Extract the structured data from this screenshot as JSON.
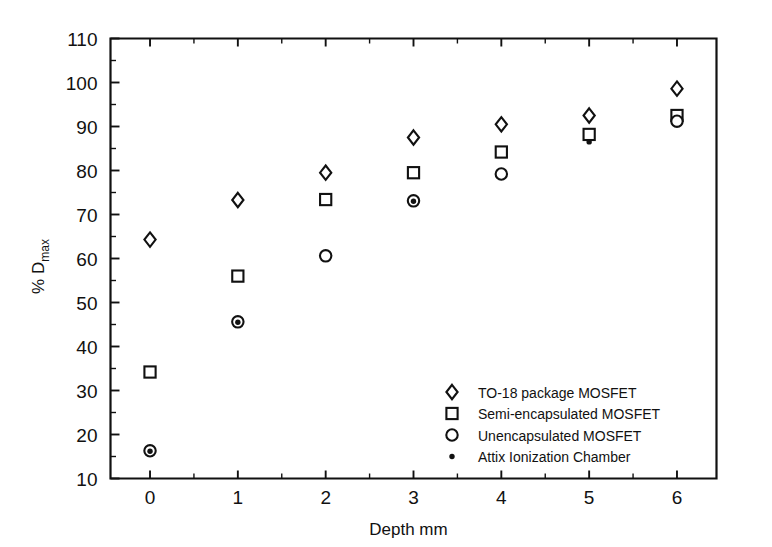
{
  "figure": {
    "background_color": "#ffffff",
    "ink_color": "#111111"
  },
  "axes": {
    "x_title": "Depth mm",
    "y_title_main": "% D",
    "y_title_sub": "max",
    "x_ticks": [
      "0",
      "1",
      "2",
      "3",
      "4",
      "5",
      "6"
    ],
    "y_ticks": [
      "10",
      "20",
      "30",
      "40",
      "50",
      "60",
      "70",
      "80",
      "90",
      "100",
      "110"
    ]
  },
  "legend": {
    "entries": [
      {
        "marker": "diamond-open-marker",
        "label": "TO-18 package MOSFET"
      },
      {
        "marker": "square-open-marker",
        "label": "Semi-encapsulated MOSFET"
      },
      {
        "marker": "circle-open-marker",
        "label": "Unencapsulated MOSFET"
      },
      {
        "marker": "dot-filled-marker",
        "label": "Attix Ionization Chamber"
      }
    ]
  },
  "chart_data": {
    "type": "scatter",
    "title": "",
    "xlabel": "Depth mm",
    "ylabel": "% D_max",
    "xlim": [
      -0.45,
      6.45
    ],
    "ylim": [
      10,
      110
    ],
    "x_tick_values": [
      0,
      1,
      2,
      3,
      4,
      5,
      6
    ],
    "y_tick_values": [
      10,
      20,
      30,
      40,
      50,
      60,
      70,
      80,
      90,
      100,
      110
    ],
    "x_minor_tick_step": 0.5,
    "y_minor_tick_step": 5,
    "grid": false,
    "legend_position": "lower-right-inside",
    "x": [
      0,
      1,
      2,
      3,
      4,
      5,
      6
    ],
    "series": [
      {
        "name": "TO-18 package MOSFET",
        "marker": "diamond-open",
        "values": [
          64.3,
          73.3,
          79.5,
          87.5,
          90.5,
          92.5,
          98.6
        ]
      },
      {
        "name": "Semi-encapsulated MOSFET",
        "marker": "square-open",
        "values": [
          34.2,
          56.0,
          73.4,
          79.5,
          84.2,
          88.2,
          92.5
        ]
      },
      {
        "name": "Unencapsulated MOSFET",
        "marker": "circle-open",
        "values": [
          16.3,
          45.6,
          60.6,
          73.1,
          79.2,
          null,
          91.2
        ]
      },
      {
        "name": "Attix Ionization Chamber",
        "marker": "dot-filled",
        "values": [
          16.2,
          45.5,
          null,
          73.0,
          null,
          86.5,
          null
        ]
      }
    ]
  }
}
